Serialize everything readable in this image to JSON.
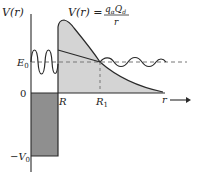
{
  "labels": {
    "y_axis": "V(r)",
    "formula_lhs": "V(r) =",
    "formula_num": "qₐQₐ",
    "formula_num_display": "qₐQ_d",
    "formula_den": "r",
    "energy": "E",
    "energy_sub": "0",
    "zero": "0",
    "neg_v0_prefix": "−V",
    "neg_v0_sub": "0",
    "R": "R",
    "R1": "R",
    "R1_sub": "1",
    "x_axis": "r"
  },
  "formula": {
    "lhs": "V(r) =",
    "numerator_q": "q",
    "numerator_q_sub": "α",
    "numerator_Q": "Q",
    "numerator_Q_sub": "d",
    "denominator": "r"
  },
  "colors": {
    "well_fill": "#8f8f8f",
    "barrier_fill": "#d4d4d4",
    "line": "#2a2a2a",
    "dashed": "#777777"
  },
  "regions": [
    {
      "name": "potential-well",
      "description": "square well of depth -V0 for r < R"
    },
    {
      "name": "coulomb-barrier",
      "description": "Coulomb barrier V(r) = qαQd/r for r > R"
    },
    {
      "name": "tunneling-region",
      "description": "classically forbidden region between R and R1 at energy E0"
    }
  ]
}
